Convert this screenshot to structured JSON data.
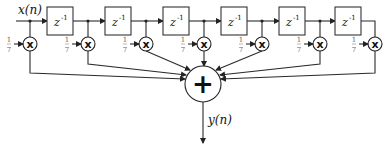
{
  "diagram": {
    "type": "FIR moving-average filter block diagram",
    "input_label": "x(n)",
    "output_label": "y(n)",
    "delay_label": "z",
    "delay_exponent": "-1",
    "delay_count": 6,
    "coefficient": {
      "numerator": "1",
      "denominator": "7"
    },
    "multiplier_symbol": "x",
    "multiplier_count": 7,
    "sum_symbol": "+",
    "colors": {
      "line": "#2a2a2a",
      "coefficient_text": "#666666"
    }
  }
}
